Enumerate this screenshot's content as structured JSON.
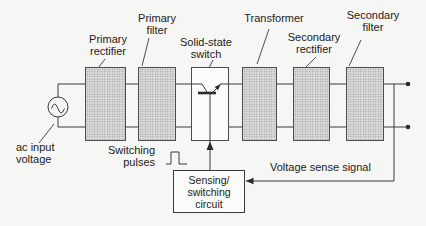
{
  "diagram_type": "block-diagram",
  "blocks": {
    "primary_rectifier": {
      "line1": "Primary",
      "line2": "rectifier"
    },
    "primary_filter": {
      "line1": "Primary",
      "line2": "filter"
    },
    "solid_state_switch": {
      "line1": "Solid-state",
      "line2": "switch"
    },
    "transformer": {
      "line1": "Transformer"
    },
    "secondary_rectifier": {
      "line1": "Secondary",
      "line2": "rectifier"
    },
    "secondary_filter": {
      "line1": "Secondary",
      "line2": "filter"
    }
  },
  "source_label": {
    "line1": "ac input",
    "line2": "voltage"
  },
  "annotations": {
    "switching_pulses": {
      "line1": "Switching",
      "line2": "pulses"
    },
    "voltage_sense_signal": "Voltage sense signal"
  },
  "sensing_box": {
    "line1": "Sensing/",
    "line2": "switching",
    "line3": "circuit"
  },
  "icons": {
    "ac_source": "sine-wave-in-circle",
    "solid_state_switch": "npn-transistor-symbol",
    "switching_pulses": "square-pulse-waveform",
    "control_arrow": "solid-up-triangle",
    "sense_arrow": "solid-left-triangle",
    "output_terminals": "solid-dots"
  },
  "colors": {
    "background": "#f6f6f4",
    "line": "#3a3a3a",
    "text": "#222222",
    "block_fill": "#dedede",
    "block_dot": "#9f9f9f",
    "block_border": "#4d4d4d",
    "switch_box_fill": "#fcfcfc"
  }
}
